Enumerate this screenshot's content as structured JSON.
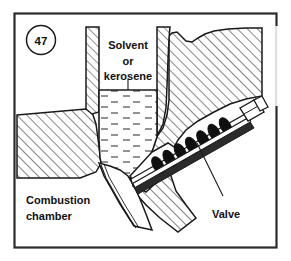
{
  "figure": {
    "number": "47",
    "frame": {
      "border_color": "#2b2b2b",
      "background": "#ffffff"
    },
    "ink_color": "#1a1a1a",
    "hatch_color": "#2b2b2b",
    "liquid_color": "#3a3a3a"
  },
  "labels": {
    "solvent_line1": "Solvent",
    "solvent_line2": "or",
    "solvent_line3": "kerosene",
    "combustion_line1": "Combustion",
    "combustion_line2": "chamber",
    "valve": "Valve"
  },
  "parts": {
    "tank_wall_left": "tank-wall-left",
    "tank_wall_right": "tank-wall-right",
    "body_block_left": "body-block-left",
    "body_block_right": "body-block-right",
    "liquid_fill": "solvent-kerosene-liquid",
    "liquid_surface": "liquid-surface-line",
    "combustion_chamber": "combustion-chamber-cavity",
    "valve_stem": "valve-stem",
    "valve_spring": "valve-spring",
    "valve_end_nut": "valve-end-nut",
    "valve_seat": "valve-seat",
    "leader_kerosene": "leader-line-kerosene",
    "leader_valve": "leader-line-valve",
    "break_line_right": "break-line-right"
  }
}
